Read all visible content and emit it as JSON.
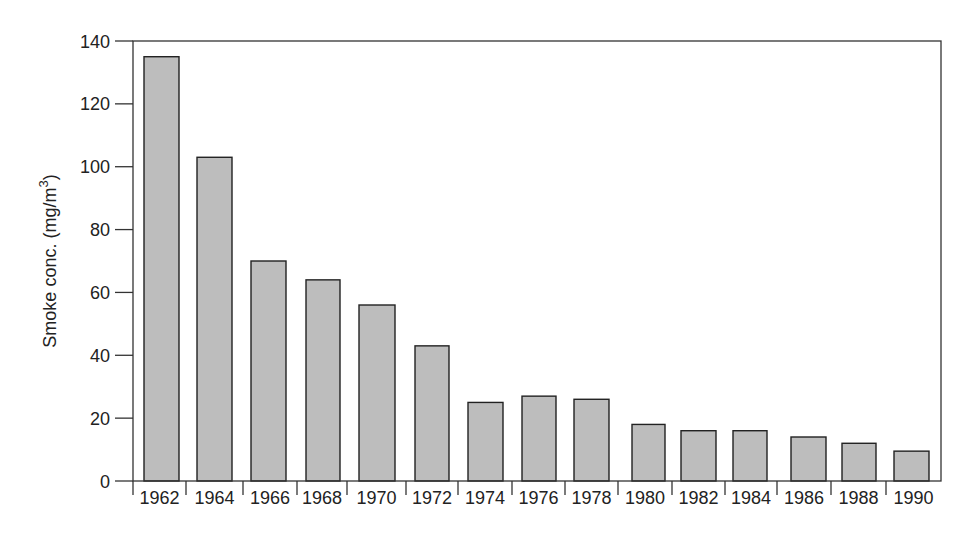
{
  "chart_data": {
    "type": "bar",
    "title": "",
    "xlabel": "",
    "ylabel": "Smoke conc. (mg/m",
    "ylabel_superscript": "3",
    "ylabel_suffix": ")",
    "ylim": [
      0,
      140
    ],
    "yticks": [
      0,
      20,
      40,
      60,
      80,
      100,
      120,
      140
    ],
    "grid": false,
    "legend": null,
    "categories": [
      "1962",
      "1964",
      "1966",
      "1968",
      "1970",
      "1972",
      "1974",
      "1976",
      "1978",
      "1980",
      "1982",
      "1984",
      "1986",
      "1988",
      "1990"
    ],
    "values": [
      135,
      103,
      70,
      64,
      56,
      43,
      25,
      27,
      26,
      18,
      16,
      16,
      14,
      12,
      9.5
    ],
    "bar_color": "#bdbdbd",
    "bar_edge_color": "#222222"
  },
  "layout": {
    "plot": {
      "left": 133,
      "right": 941,
      "top": 41,
      "bottom": 481
    },
    "tick_x": [
      133,
      186,
      243,
      297,
      347,
      406,
      458,
      512,
      565,
      618,
      672,
      725,
      777,
      831,
      886
    ],
    "bar_x": [
      [
        144,
        179
      ],
      [
        197,
        232
      ],
      [
        251,
        286
      ],
      [
        306,
        340
      ],
      [
        359,
        395
      ],
      [
        415,
        449
      ],
      [
        468,
        503
      ],
      [
        522,
        556
      ],
      [
        574,
        609
      ],
      [
        632,
        665
      ],
      [
        681,
        716
      ],
      [
        733,
        767
      ],
      [
        791,
        826
      ],
      [
        842,
        876
      ],
      [
        894,
        929
      ]
    ]
  }
}
